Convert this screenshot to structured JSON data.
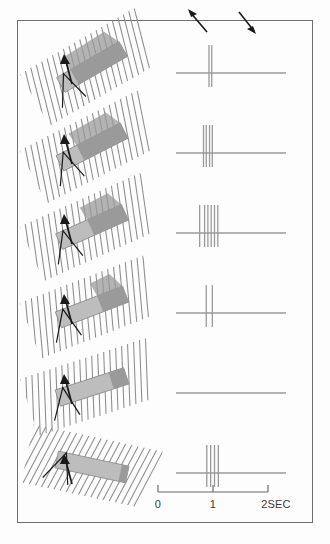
{
  "figure": {
    "background_color": "#fdfdfd",
    "frame_color": "#6e6e6e"
  },
  "colors": {
    "hatch_line": "#8c8c8c",
    "bar_light": "#bdbdbd",
    "bar_dark": "#9a9a9a",
    "bar_outline": "#8a8a8a",
    "trace_line": "#9a9a9a",
    "spike_line": "#9a9a9a",
    "arrow": "#1a1a1a",
    "axis": "#6b6b6b",
    "text": "#3a3a3a"
  },
  "motion_arrows": [
    {
      "name": "up-left-arrow",
      "direction": "up-left",
      "label": ""
    },
    {
      "name": "down-right-arrow",
      "direction": "down-right",
      "label": ""
    }
  ],
  "time_axis": {
    "name": "time-axis",
    "unit": "SEC",
    "min": 0,
    "max": 2,
    "ticks": [
      {
        "value": 0,
        "label": "0"
      },
      {
        "value": 1,
        "label": "1"
      },
      {
        "value": 2,
        "label": "2SEC"
      }
    ]
  },
  "chart_data": {
    "type": "raster",
    "xlabel": "2SEC",
    "ylabel": "",
    "xlim": [
      0,
      2
    ],
    "grid": false,
    "legend": "none",
    "categories": [
      "row-1",
      "row-2",
      "row-3",
      "row-4",
      "row-5",
      "row-6"
    ],
    "values": [
      2,
      4,
      6,
      2,
      0,
      4
    ],
    "series": [
      {
        "name": "spike-times-seconds",
        "rows": [
          {
            "row": 1,
            "orientation_deg": 30,
            "bar_angle_deg": 30,
            "dark_fraction": 0.78,
            "spike_count": 2,
            "spike_times": [
              0.6,
              0.65
            ]
          },
          {
            "row": 2,
            "orientation_deg": 27,
            "bar_angle_deg": 27,
            "dark_fraction": 0.68,
            "spike_count": 4,
            "spike_times": [
              0.5,
              0.55,
              0.61,
              0.66
            ]
          },
          {
            "row": 3,
            "orientation_deg": 24,
            "bar_angle_deg": 24,
            "dark_fraction": 0.52,
            "spike_count": 6,
            "spike_times": [
              0.43,
              0.52,
              0.58,
              0.64,
              0.7,
              0.76
            ]
          },
          {
            "row": 4,
            "orientation_deg": 21,
            "bar_angle_deg": 21,
            "dark_fraction": 0.38,
            "spike_count": 2,
            "spike_times": [
              0.55,
              0.66
            ]
          },
          {
            "row": 5,
            "orientation_deg": 18,
            "bar_angle_deg": 18,
            "dark_fraction": 0.22,
            "spike_count": 0,
            "spike_times": []
          },
          {
            "row": 6,
            "orientation_deg": -12,
            "bar_angle_deg": -12,
            "dark_fraction": 0.1,
            "spike_count": 4,
            "spike_times": [
              0.56,
              0.63,
              0.7,
              0.77
            ]
          }
        ]
      }
    ]
  },
  "rows": [
    {
      "name": "stimulus-response-row-1",
      "stimulus_name": "oriented-bar-stimulus-1",
      "trace_name": "spike-train-1"
    },
    {
      "name": "stimulus-response-row-2",
      "stimulus_name": "oriented-bar-stimulus-2",
      "trace_name": "spike-train-2"
    },
    {
      "name": "stimulus-response-row-3",
      "stimulus_name": "oriented-bar-stimulus-3",
      "trace_name": "spike-train-3"
    },
    {
      "name": "stimulus-response-row-4",
      "stimulus_name": "oriented-bar-stimulus-4",
      "trace_name": "spike-train-4"
    },
    {
      "name": "stimulus-response-row-5",
      "stimulus_name": "oriented-bar-stimulus-5",
      "trace_name": "spike-train-5"
    },
    {
      "name": "stimulus-response-row-6",
      "stimulus_name": "oriented-bar-stimulus-6",
      "trace_name": "spike-train-6"
    }
  ]
}
